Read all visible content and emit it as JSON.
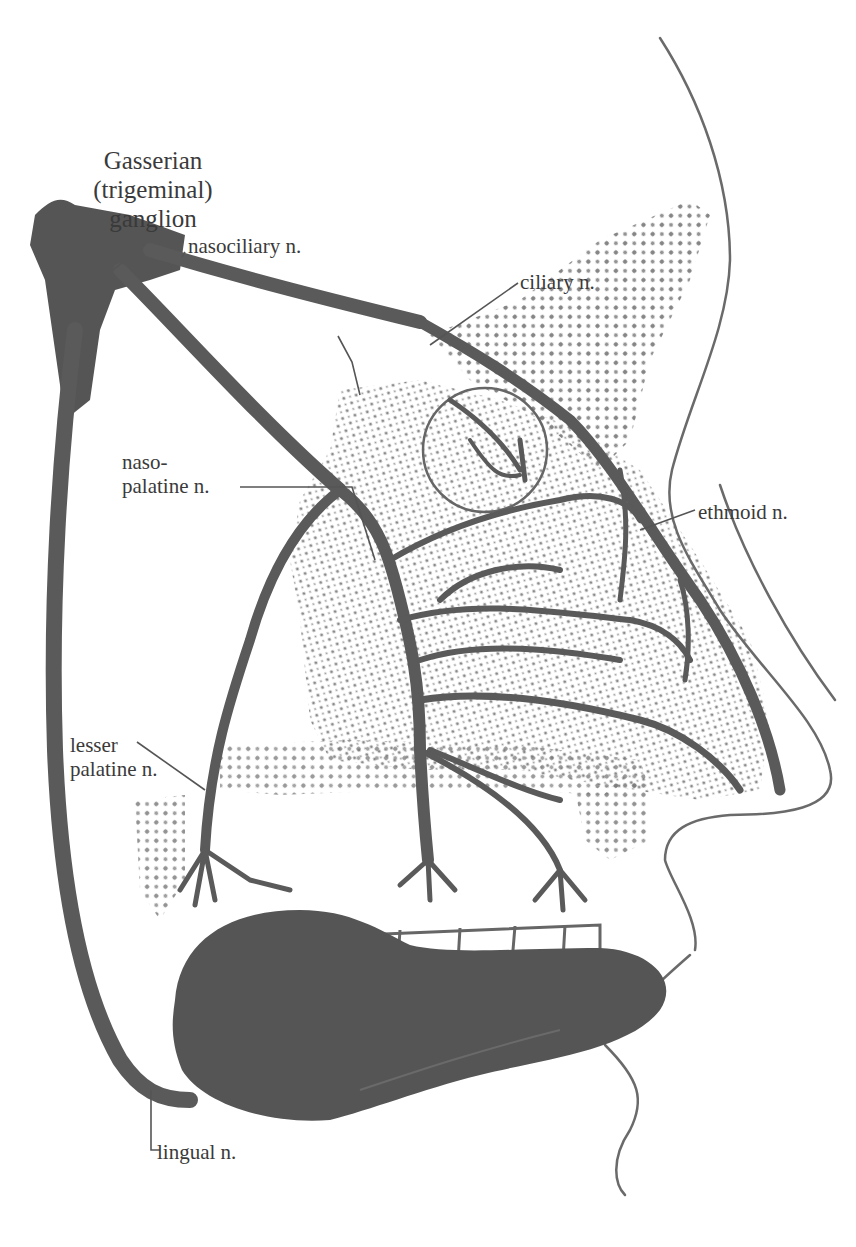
{
  "figure": {
    "colors": {
      "nerve": "#5a5a5a",
      "tongue": "#555555",
      "stipple": "#777777",
      "outline": "#6a6a6a",
      "text": "#3a3a3a",
      "background": "#ffffff"
    }
  },
  "labels": {
    "ganglion": {
      "line1": "Gasserian",
      "line2": "(trigeminal)",
      "line3": "ganglion"
    },
    "nasociliary": "nasociliary n.",
    "ciliary": "ciliary n.",
    "nasopalatine": {
      "line1": "naso-",
      "line2": "palatine n."
    },
    "ethmoid": "ethmoid  n.",
    "lesser_palatine": {
      "line1": "lesser",
      "line2": "palatine n."
    },
    "lingual": "lingual n."
  }
}
